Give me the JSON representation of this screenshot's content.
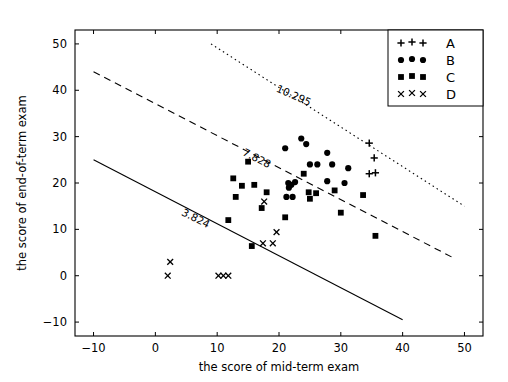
{
  "chart_data": {
    "type": "scatter",
    "title": "",
    "xlabel": "the score of mid-term exam",
    "ylabel": "the score of end-of-term exam",
    "xlim": [
      -13,
      53
    ],
    "ylim": [
      -13,
      53
    ],
    "xticks": [
      -10,
      0,
      10,
      20,
      30,
      40,
      50
    ],
    "yticks": [
      -10,
      0,
      10,
      20,
      30,
      40,
      50
    ],
    "xticklabels": [
      "−10",
      "0",
      "10",
      "20",
      "30",
      "40",
      "50"
    ],
    "yticklabels": [
      "−10",
      "0",
      "10",
      "20",
      "30",
      "40",
      "50"
    ],
    "grid": false,
    "legend_position": "upper right",
    "legend_entries": [
      {
        "label": "A",
        "marker": "plus"
      },
      {
        "label": "B",
        "marker": "circle"
      },
      {
        "label": "C",
        "marker": "square"
      },
      {
        "label": "D",
        "marker": "x"
      }
    ],
    "series": [
      {
        "name": "A",
        "marker": "plus",
        "color": "#000000",
        "points": [
          [
            34.6,
            28.6
          ],
          [
            35.4,
            25.4
          ],
          [
            34.6,
            22.0
          ],
          [
            35.6,
            22.2
          ]
        ]
      },
      {
        "name": "B",
        "marker": "circle",
        "color": "#000000",
        "points": [
          [
            21.0,
            27.5
          ],
          [
            23.6,
            29.6
          ],
          [
            24.4,
            28.4
          ],
          [
            27.8,
            26.5
          ],
          [
            25.0,
            24.0
          ],
          [
            26.2,
            24.0
          ],
          [
            28.6,
            24.0
          ],
          [
            31.2,
            23.2
          ],
          [
            21.5,
            20.0
          ],
          [
            22.0,
            19.6
          ],
          [
            22.6,
            20.2
          ],
          [
            21.6,
            19.0
          ],
          [
            27.8,
            20.4
          ],
          [
            30.6,
            20.0
          ],
          [
            21.2,
            17.0
          ],
          [
            22.2,
            17.0
          ]
        ]
      },
      {
        "name": "C",
        "marker": "square",
        "color": "#000000",
        "points": [
          [
            15.0,
            24.6
          ],
          [
            12.6,
            21.0
          ],
          [
            14.0,
            19.4
          ],
          [
            16.0,
            19.6
          ],
          [
            18.0,
            18.0
          ],
          [
            13.0,
            17.0
          ],
          [
            17.2,
            14.6
          ],
          [
            24.0,
            22.0
          ],
          [
            24.8,
            18.0
          ],
          [
            26.0,
            17.8
          ],
          [
            25.0,
            16.6
          ],
          [
            29.0,
            18.4
          ],
          [
            33.6,
            17.4
          ],
          [
            30.0,
            13.6
          ],
          [
            35.6,
            8.6
          ],
          [
            21.0,
            12.6
          ],
          [
            11.8,
            12.0
          ],
          [
            15.6,
            6.4
          ]
        ]
      },
      {
        "name": "D",
        "marker": "x",
        "color": "#000000",
        "points": [
          [
            17.6,
            16.0
          ],
          [
            19.6,
            9.4
          ],
          [
            17.4,
            7.0
          ],
          [
            19.0,
            7.0
          ],
          [
            2.4,
            3.0
          ],
          [
            2.0,
            0.0
          ],
          [
            10.2,
            0.0
          ],
          [
            11.0,
            0.0
          ],
          [
            11.8,
            0.0
          ]
        ]
      }
    ],
    "lines": [
      {
        "name": "upper-boundary",
        "style": "dotted",
        "label": "10.295",
        "x0": 9.0,
        "y0": 50.0,
        "x1": 50.0,
        "y1": 15.0,
        "label_x": 22.5,
        "label_y": 39.0,
        "label_angle": 24
      },
      {
        "name": "middle-boundary",
        "style": "dashed",
        "label": "7.828",
        "x0": -10.0,
        "y0": 44.0,
        "x1": 48.0,
        "y1": 4.0,
        "label_x": 16.5,
        "label_y": 25.5,
        "label_angle": 27
      },
      {
        "name": "lower-boundary",
        "style": "solid",
        "label": "3.824",
        "x0": -10.0,
        "y0": 25.0,
        "x1": 40.0,
        "y1": -9.5,
        "label_x": 6.5,
        "label_y": 12.5,
        "label_angle": 27
      }
    ]
  }
}
